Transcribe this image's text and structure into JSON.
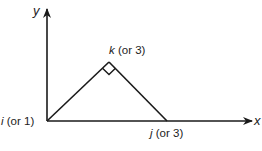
{
  "diagram": {
    "type": "coordinate triangle",
    "axes": {
      "x_label": "x",
      "y_label": "y"
    },
    "points": {
      "i": {
        "var": "i",
        "suffix": " (or 1)"
      },
      "k": {
        "var": "k",
        "suffix": " (or 3)"
      },
      "j": {
        "var": "j",
        "suffix": " (or 3)"
      }
    },
    "right_angle_at": "k",
    "colors": {
      "stroke": "#1a1a1a",
      "background": "#ffffff"
    }
  }
}
